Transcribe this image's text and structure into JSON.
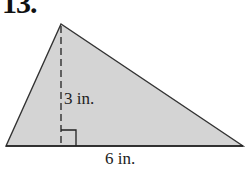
{
  "problem_number": "13.",
  "figure": {
    "shape": "triangle",
    "fill_color": "#d4d4d4",
    "stroke_color": "#333333",
    "height_label": "3 in.",
    "base_label": "6 in."
  }
}
